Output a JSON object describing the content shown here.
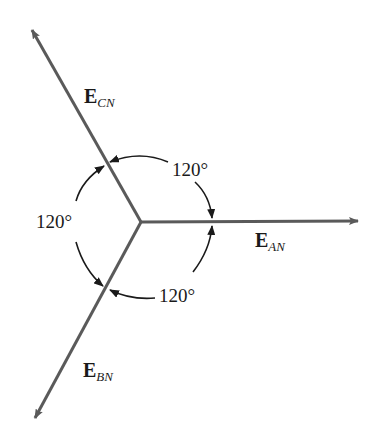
{
  "diagram": {
    "type": "phasor-diagram",
    "center": [
      141,
      222
    ],
    "colors": {
      "phasor": "#5a5a5a",
      "arc": "#1a1a1a",
      "text": "#1a1a1a",
      "background": "#ffffff"
    },
    "phasors": [
      {
        "id": "EAN",
        "symbol": "E",
        "subscript": "AN",
        "angle_deg": 0,
        "tip": [
          358,
          221
        ]
      },
      {
        "id": "EBN",
        "symbol": "E",
        "subscript": "BN",
        "angle_deg": -120,
        "tip": [
          35,
          418
        ]
      },
      {
        "id": "ECN",
        "symbol": "E",
        "subscript": "CN",
        "angle_deg": 120,
        "tip": [
          32,
          30
        ]
      }
    ],
    "angles": [
      {
        "between": [
          "ECN",
          "EAN"
        ],
        "label": "120°"
      },
      {
        "between": [
          "ECN",
          "EBN"
        ],
        "label": "120°"
      },
      {
        "between": [
          "EBN",
          "EAN"
        ],
        "label": "120°"
      }
    ]
  }
}
